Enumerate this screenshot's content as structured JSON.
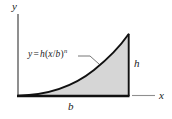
{
  "figure": {
    "kind": "spandrel-area-diagram",
    "axes": {
      "y_label": "y",
      "x_label": "x"
    },
    "dimensions": {
      "base_label": "b",
      "height_label": "h"
    },
    "equation": {
      "lhs": "y",
      "equals": "=",
      "coefficient": "h",
      "open_paren": "(",
      "numerator": "x",
      "slash": "/",
      "denominator": "b",
      "close_paren": ")",
      "exponent": "n",
      "full_text": "y = h(x/b)n"
    },
    "colors": {
      "fill": "#d6d6d6",
      "stroke": "#111111",
      "axis": "#8a8a8a",
      "text": "#1a1a1a"
    }
  }
}
